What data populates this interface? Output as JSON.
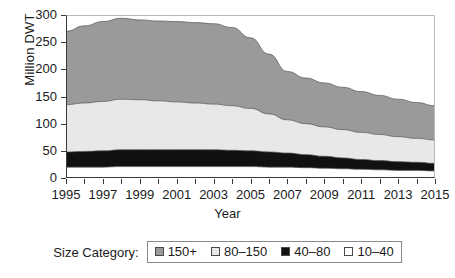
{
  "chart_data": {
    "type": "area",
    "stacked": true,
    "title": "",
    "xlabel": "Year",
    "ylabel": "Million DWT",
    "xlim": [
      1995,
      2015
    ],
    "ylim": [
      0,
      300
    ],
    "yticks": [
      0,
      50,
      100,
      150,
      200,
      250,
      300
    ],
    "xticks": [
      1995,
      1997,
      1999,
      2001,
      2003,
      2005,
      2007,
      2009,
      2011,
      2013,
      2015
    ],
    "x": [
      1995,
      1996,
      1997,
      1998,
      1999,
      2000,
      2001,
      2002,
      2003,
      2004,
      2005,
      2006,
      2007,
      2008,
      2009,
      2010,
      2011,
      2012,
      2013,
      2014,
      2015
    ],
    "grid": false,
    "legend_position": "bottom",
    "legend_title": "Size Category:",
    "stack_order_bottom_to_top": [
      "10–40",
      "40–80",
      "80–150",
      "150+"
    ],
    "series": [
      {
        "name": "10–40",
        "color": "#ffffff",
        "values": [
          20,
          20,
          20,
          21,
          21,
          21,
          21,
          21,
          21,
          21,
          21,
          20,
          20,
          19,
          18,
          17,
          16,
          15,
          14,
          14,
          13
        ]
      },
      {
        "name": "40–80",
        "color": "#111111",
        "values": [
          28,
          29,
          30,
          31,
          31,
          31,
          31,
          31,
          31,
          30,
          29,
          28,
          26,
          24,
          22,
          20,
          18,
          17,
          16,
          15,
          14
        ]
      },
      {
        "name": "80–150",
        "color": "#e8e8e8",
        "values": [
          87,
          89,
          91,
          93,
          92,
          90,
          88,
          86,
          84,
          82,
          78,
          70,
          61,
          57,
          54,
          52,
          50,
          48,
          46,
          44,
          43
        ]
      },
      {
        "name": "150+",
        "color": "#9a9a9a",
        "values": [
          135,
          142,
          147,
          149,
          147,
          147,
          148,
          148,
          148,
          144,
          130,
          110,
          89,
          84,
          81,
          78,
          75,
          72,
          69,
          66,
          63
        ]
      }
    ],
    "cumulative_tops": {
      "10–40": [
        20,
        20,
        20,
        21,
        21,
        21,
        21,
        21,
        21,
        21,
        21,
        20,
        20,
        19,
        18,
        17,
        16,
        15,
        14,
        14,
        13
      ],
      "40–80": [
        48,
        49,
        50,
        52,
        52,
        52,
        52,
        52,
        52,
        51,
        50,
        48,
        46,
        43,
        40,
        37,
        34,
        32,
        30,
        29,
        27
      ],
      "80–150": [
        135,
        138,
        141,
        145,
        144,
        142,
        140,
        138,
        136,
        133,
        128,
        118,
        107,
        100,
        94,
        89,
        84,
        80,
        76,
        73,
        70
      ],
      "150+": [
        270,
        280,
        288,
        294,
        291,
        289,
        288,
        286,
        284,
        277,
        258,
        228,
        196,
        184,
        175,
        167,
        159,
        152,
        145,
        139,
        133
      ]
    }
  },
  "axes": {
    "ylabel": "Million DWT",
    "xlabel": "Year",
    "ytick_labels": [
      "300",
      "250",
      "200",
      "150",
      "100",
      "50",
      "0"
    ],
    "xtick_labels": [
      "1995",
      "1997",
      "1999",
      "2001",
      "2003",
      "2005",
      "2007",
      "2009",
      "2011",
      "2013",
      "2015"
    ]
  },
  "legend": {
    "title": "Size Category:",
    "items": [
      {
        "label": "150+",
        "color": "#9a9a9a"
      },
      {
        "label": "80–150",
        "color": "#e8e8e8"
      },
      {
        "label": "40–80",
        "color": "#111111"
      },
      {
        "label": "10–40",
        "color": "#ffffff"
      }
    ]
  }
}
